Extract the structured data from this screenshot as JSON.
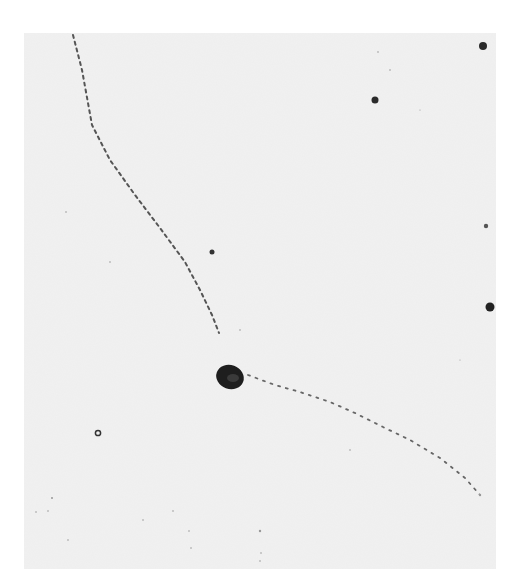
{
  "image": {
    "description": "Monochrome photomicrograph showing dotted particle tracks converging on a dark central blob, with scattered dark grains",
    "background_color": "#f1f1f1",
    "frame_color": "#ffffff",
    "ink_color": "#2a2a2a"
  },
  "features": {
    "central_blob": {
      "cx": 230,
      "cy": 377,
      "rx": 14,
      "ry": 12
    },
    "track_1": {
      "label": "upper-left track",
      "points": [
        [
          73,
          35
        ],
        [
          82,
          70
        ],
        [
          92,
          125
        ],
        [
          110,
          160
        ],
        [
          135,
          195
        ],
        [
          160,
          228
        ],
        [
          185,
          262
        ],
        [
          200,
          290
        ],
        [
          212,
          315
        ],
        [
          219,
          333
        ]
      ]
    },
    "track_2": {
      "label": "lower-right track",
      "points": [
        [
          248,
          375
        ],
        [
          275,
          385
        ],
        [
          300,
          392
        ],
        [
          330,
          402
        ],
        [
          355,
          413
        ],
        [
          385,
          428
        ],
        [
          410,
          440
        ],
        [
          440,
          458
        ],
        [
          465,
          478
        ],
        [
          480,
          495
        ]
      ]
    },
    "grains": [
      {
        "cx": 483,
        "cy": 46,
        "r": 4
      },
      {
        "cx": 375,
        "cy": 100,
        "r": 3.5
      },
      {
        "cx": 212,
        "cy": 252,
        "r": 2.5
      },
      {
        "cx": 486,
        "cy": 226,
        "r": 2.2
      },
      {
        "cx": 490,
        "cy": 307,
        "r": 4.5
      }
    ],
    "ring": {
      "cx": 98,
      "cy": 433,
      "r": 3
    }
  }
}
